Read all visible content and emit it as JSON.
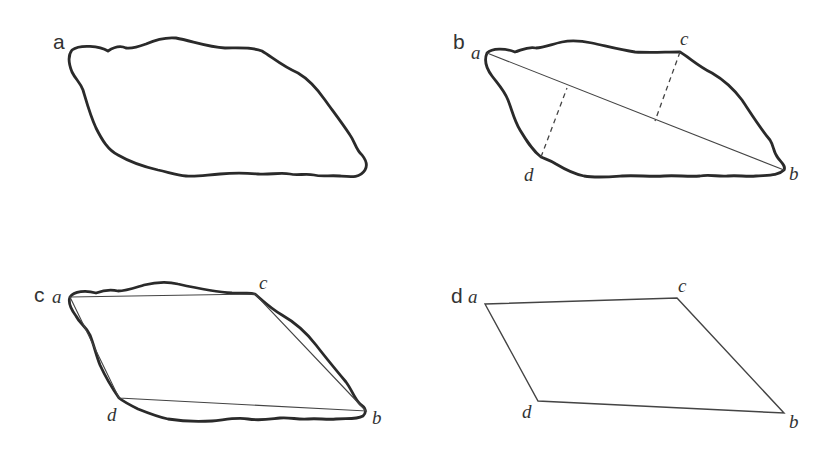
{
  "figure": {
    "panels": [
      {
        "id": "a",
        "label": "a",
        "content": "irregular closed outline"
      },
      {
        "id": "b",
        "label": "b",
        "content": "outline with long axis a–b and dashed perpendiculars to points c and d",
        "vertices": {
          "a": "a",
          "b": "b",
          "c": "c",
          "d": "d"
        }
      },
      {
        "id": "c",
        "label": "c",
        "content": "outline with inscribed quadrilateral a–c–b–d",
        "vertices": {
          "a": "a",
          "b": "b",
          "c": "c",
          "d": "d"
        }
      },
      {
        "id": "d",
        "label": "d",
        "content": "resulting quadrilateral a–c–b–d",
        "vertices": {
          "a": "a",
          "b": "b",
          "c": "c",
          "d": "d"
        }
      }
    ]
  },
  "colors": {
    "stroke": "#2a2a2a",
    "text": "#333333",
    "background": "#ffffff"
  }
}
